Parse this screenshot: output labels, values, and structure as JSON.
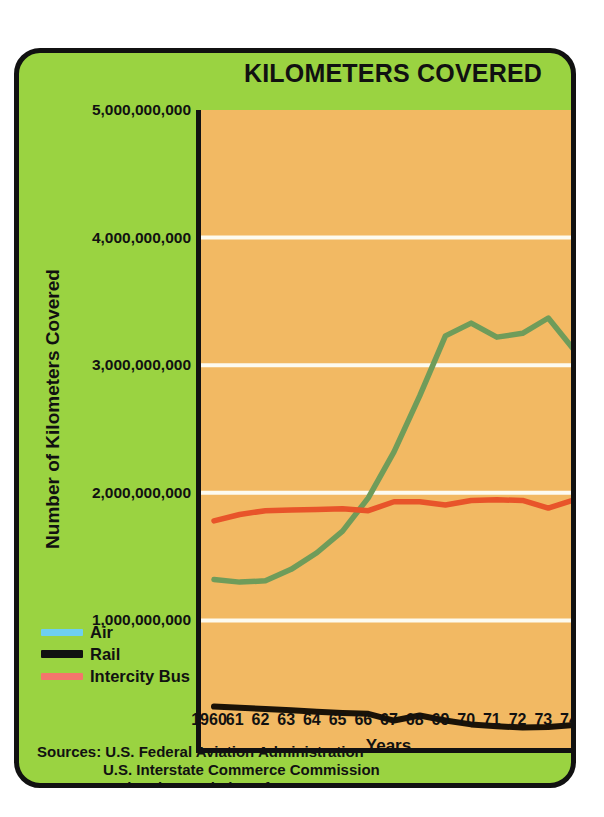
{
  "chart_data": {
    "type": "line",
    "title": "KILOMETERS COVERED",
    "xlabel": "Years",
    "ylabel": "Number of Kilometers Covered",
    "x": [
      1960,
      1961,
      1962,
      1963,
      1964,
      1965,
      1966,
      1967,
      1968,
      1969,
      1970,
      1971,
      1972,
      1973,
      1974
    ],
    "x_tick_labels": [
      "1960",
      "61",
      "62",
      "63",
      "64",
      "65",
      "66",
      "67",
      "68",
      "69",
      "70",
      "71",
      "72",
      "73",
      "74"
    ],
    "y_tick_labels": [
      "5,000,000,000",
      "4,000,000,000",
      "3,000,000,000",
      "2,000,000,000",
      "1,000,000,000"
    ],
    "y_tick_values": [
      5000000000,
      4000000000,
      3000000000,
      2000000000,
      1000000000
    ],
    "ylim": [
      0,
      5000000000
    ],
    "xlim": [
      1960,
      1974
    ],
    "grid": "horizontal-white",
    "legend_position": "left-outside-below",
    "series": [
      {
        "name": "Air",
        "color": "#6f9c5a",
        "legend_color": "#6ecff0",
        "values": [
          1320000000,
          1300000000,
          1310000000,
          1400000000,
          1530000000,
          1700000000,
          1960000000,
          2320000000,
          2760000000,
          3230000000,
          3330000000,
          3220000000,
          3250000000,
          3370000000,
          3120000000
        ]
      },
      {
        "name": "Rail",
        "color": "#1a1207",
        "legend_color": "#111111",
        "values": [
          325000000,
          315000000,
          305000000,
          295000000,
          285000000,
          275000000,
          268000000,
          215000000,
          255000000,
          215000000,
          185000000,
          170000000,
          160000000,
          165000000,
          180000000
        ]
      },
      {
        "name": "Intercity Bus",
        "color": "#e8542a",
        "legend_color": "#f4756c",
        "values": [
          1780000000,
          1830000000,
          1860000000,
          1865000000,
          1870000000,
          1875000000,
          1860000000,
          1930000000,
          1930000000,
          1905000000,
          1940000000,
          1945000000,
          1940000000,
          1880000000,
          1945000000
        ]
      }
    ]
  },
  "legend": {
    "items": [
      {
        "label": "Air",
        "swatch_color": "#6ecff0"
      },
      {
        "label": "Rail",
        "swatch_color": "#111111"
      },
      {
        "label": "Intercity Bus",
        "swatch_color": "#f4756c"
      }
    ]
  },
  "sources": {
    "lines": [
      "Sources: U.S. Federal Aviation Administration",
      "U.S. Interstate Commerce Commission",
      "National Association of Motor Bus Owners"
    ]
  },
  "colors": {
    "card_background": "#9ad341",
    "plot_background": "#f2b963",
    "border": "#111111",
    "gridline": "#fdfbf0",
    "page_background": "#ffffff"
  }
}
